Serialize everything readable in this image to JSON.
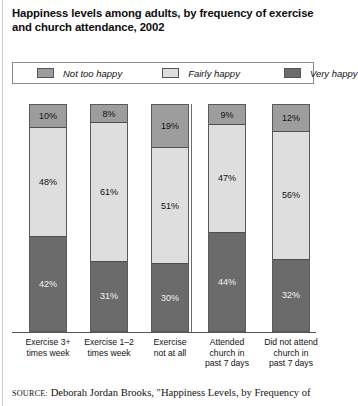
{
  "title": "Happiness levels among adults, by frequency of exercise and church attendance, 2002",
  "source": {
    "label": "SOURCE:",
    "text": "Deborah Jordan Brooks, \"Happiness Levels, by Frequency of"
  },
  "colors": {
    "not_too_happy": "#9d9d9d",
    "fairly_happy": "#dedede",
    "very_happy": "#6b6b6b",
    "axis": "#555555",
    "background": "#ffffff"
  },
  "chart_data": {
    "type": "bar",
    "title": "Happiness levels among adults, by frequency of exercise and church attendance, 2002",
    "xlabel": "",
    "ylabel": "",
    "ylim": [
      0,
      100
    ],
    "stacked": true,
    "grid": false,
    "legend_position": "top",
    "categories": [
      "Exercise 3+ times week",
      "Exercise 1–2 times week",
      "Exercise not at all",
      "Attended church in past 7 days",
      "Did not attend church in past 7 days"
    ],
    "category_lines": [
      [
        "Exercise 3+",
        "times week"
      ],
      [
        "Exercise 1–2",
        "times week"
      ],
      [
        "Exercise",
        "not at all"
      ],
      [
        "Attended",
        "church in",
        "past 7 days"
      ],
      [
        "Did not attend",
        "church in",
        "past 7 days"
      ]
    ],
    "group_divider_after_index": 2,
    "series": [
      {
        "name": "Not too happy",
        "values": [
          10,
          8,
          19,
          9,
          12
        ],
        "labels": [
          "10%",
          "8%",
          "19%",
          "9%",
          "12%"
        ]
      },
      {
        "name": "Fairly happy",
        "values": [
          48,
          61,
          51,
          47,
          56
        ],
        "labels": [
          "48%",
          "61%",
          "51%",
          "47%",
          "56%"
        ]
      },
      {
        "name": "Very happy",
        "values": [
          42,
          31,
          30,
          44,
          32
        ],
        "labels": [
          "42%",
          "31%",
          "30%",
          "44%",
          "32%"
        ]
      }
    ]
  },
  "legend": {
    "items": [
      {
        "label": "Not too happy",
        "color": "#9d9d9d"
      },
      {
        "label": "Fairly happy",
        "color": "#dedede"
      },
      {
        "label": "Very happy",
        "color": "#6b6b6b"
      }
    ]
  }
}
